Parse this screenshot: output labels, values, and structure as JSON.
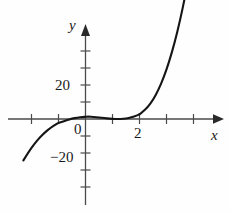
{
  "figure": {
    "name": "cubic-function-graph",
    "background_color": "#fefefe",
    "curve_color": "#151515",
    "axis_color": "#4a4a4a",
    "text_color": "#1a1a1a"
  },
  "labels": {
    "y_axis_name": "y",
    "x_axis_name": "x",
    "y_tick_20": "20",
    "y_tick_neg20": "−20",
    "x_tick_0": "0",
    "x_tick_2": "2"
  },
  "chart_data": {
    "type": "line",
    "title": "",
    "subtitle": "",
    "xlabel": "x",
    "ylabel": "y",
    "xlim": [
      -2.3,
      5.1
    ],
    "ylim": [
      -42,
      45
    ],
    "grid": false,
    "legend": null,
    "axis_origin_px": {
      "x": 85.5,
      "y": 119.0
    },
    "scale_px_per_unit": {
      "x": 27.0,
      "y": 1.71
    },
    "x_ticks_labeled": [
      {
        "value": 0,
        "label": "0"
      },
      {
        "value": 2,
        "label": "2"
      }
    ],
    "x_ticks_unlabeled": [
      -2,
      -1,
      1,
      3,
      4
    ],
    "y_ticks_labeled": [
      {
        "value": 20,
        "label": "20"
      },
      {
        "value": -20,
        "label": "−20"
      }
    ],
    "y_ticks_unlabeled": [
      10,
      30,
      40,
      -10,
      -30,
      -40
    ],
    "function_expression": "y = (x + 1)(x - 2)^2",
    "roots": [
      -1,
      2
    ],
    "local_maximum": {
      "x": 0,
      "y": 4
    },
    "local_minimum": {
      "x": 2,
      "y": 0
    },
    "series": [
      {
        "name": "cubic",
        "x": [
          -2.3,
          -2.1,
          -1.9,
          -1.7,
          -1.5,
          -1.3,
          -1.1,
          -1.0,
          -0.9,
          -0.7,
          -0.5,
          -0.3,
          -0.1,
          0.0,
          0.1,
          0.3,
          0.5,
          0.7,
          0.9,
          1.1,
          1.3,
          1.5,
          1.7,
          1.9,
          2.0,
          2.1,
          2.3,
          2.5,
          2.7,
          2.9,
          3.1,
          3.3,
          3.5,
          3.7,
          3.9,
          4.1,
          4.3,
          4.5
        ],
        "y": [
          -24.2,
          -19.1,
          -14.7,
          -10.9,
          -7.8,
          -5.2,
          -3.2,
          -2.2,
          -1.8,
          -0.7,
          0.2,
          0.8,
          1.2,
          1.3,
          1.4,
          1.2,
          0.9,
          0.5,
          0.2,
          0.0,
          0.0,
          0.3,
          0.9,
          2.0,
          2.8,
          3.9,
          6.8,
          11.2,
          17.0,
          24.4,
          33.6,
          44.6,
          57.5,
          72.5,
          89.7,
          109.0,
          130.8,
          155.0
        ]
      }
    ],
    "curve_path_px": "M 23,212 C 32,190 44,160 58,140 C 70,124 80,115 88,111 C 94,109 99,110 104,113 C 112,117 120,119 130,119.5 C 135,119.6 138,119.5 140,119 C 144,117 148,112 152,104 C 158,92 164,76 172,58 C 180,42 192,26 205,20"
  }
}
